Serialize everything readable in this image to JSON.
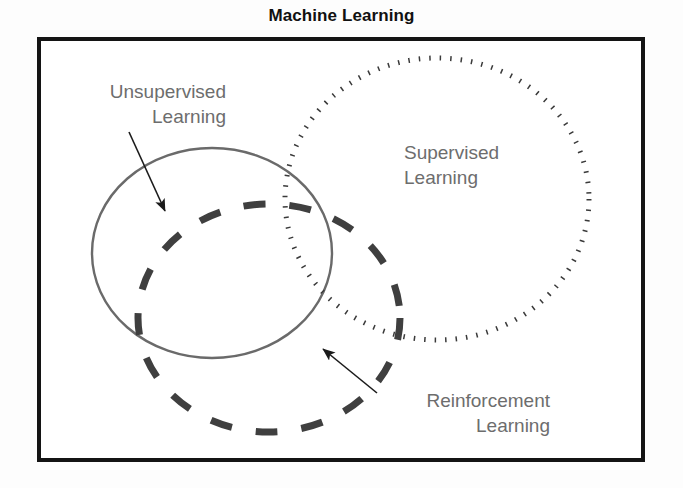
{
  "figure": {
    "title": "Machine Learning",
    "background_color": "#ffffff",
    "frame_color": "#141414",
    "label_color": "#6d6d6d"
  },
  "diagram": {
    "type": "venn",
    "set_count": 3,
    "sets": [
      {
        "id": "unsupervised",
        "label": "Unsupervised\nLearning",
        "stroke_style": "solid",
        "stroke_color": "#6a6a6a",
        "stroke_width": 2.4,
        "center": [
          212,
          253
        ],
        "radius": [
          120,
          105
        ],
        "label_anchor": "right",
        "has_leader_arrow": true
      },
      {
        "id": "supervised",
        "label": "Supervised\nLearning",
        "stroke_style": "dotted",
        "stroke_color": "#3a3a3a",
        "stroke_width": 5,
        "center": [
          437,
          199
        ],
        "radius": [
          152,
          141
        ],
        "label_anchor": "left",
        "has_leader_arrow": false
      },
      {
        "id": "reinforcement",
        "label": "Reinforcement\nLearning",
        "stroke_style": "dashed",
        "stroke_color": "#3f3f3f",
        "stroke_width": 7,
        "center": [
          269,
          318
        ],
        "radius": [
          131,
          114
        ],
        "label_anchor": "right",
        "has_leader_arrow": true
      }
    ],
    "arrows": [
      {
        "id": "arrow-unsupervised",
        "from": [
          129,
          132
        ],
        "to": [
          167,
          214
        ],
        "points_to": "unsupervised"
      },
      {
        "id": "arrow-reinforcement",
        "from": [
          377,
          393
        ],
        "to": [
          320,
          346
        ],
        "points_to": "reinforcement"
      }
    ]
  }
}
